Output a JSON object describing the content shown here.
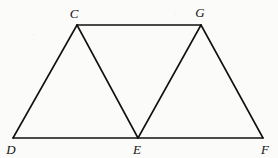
{
  "figure": {
    "background_color": "#fbfbfa",
    "stroke_color": "#111111",
    "stroke_width": 1.6,
    "width": 278,
    "height": 158,
    "points": {
      "C": {
        "label": "C",
        "x": 77,
        "y": 25
      },
      "G": {
        "label": "G",
        "x": 201,
        "y": 25
      },
      "D": {
        "label": "D",
        "x": 13,
        "y": 138
      },
      "E": {
        "label": "E",
        "x": 138,
        "y": 138
      },
      "F": {
        "label": "F",
        "x": 263,
        "y": 138
      }
    },
    "labels": [
      {
        "name": "vertex-label-C",
        "text": "C",
        "x": 74,
        "y": 13
      },
      {
        "name": "vertex-label-G",
        "text": "G",
        "x": 200,
        "y": 12
      },
      {
        "name": "vertex-label-D",
        "text": "D",
        "x": 11,
        "y": 149
      },
      {
        "name": "vertex-label-E",
        "text": "E",
        "x": 137,
        "y": 149
      },
      {
        "name": "vertex-label-F",
        "text": "F",
        "x": 265,
        "y": 149
      }
    ],
    "segments": [
      {
        "name": "segment-CG",
        "from": "C",
        "to": "G",
        "x1": 77,
        "y1": 25,
        "x2": 201,
        "y2": 25
      },
      {
        "name": "segment-DF",
        "from": "D",
        "to": "F",
        "x1": 13,
        "y1": 138,
        "x2": 263,
        "y2": 138
      },
      {
        "name": "segment-DC",
        "from": "D",
        "to": "C",
        "x1": 13,
        "y1": 138,
        "x2": 77,
        "y2": 25
      },
      {
        "name": "segment-CE",
        "from": "C",
        "to": "E",
        "x1": 77,
        "y1": 25,
        "x2": 138,
        "y2": 138
      },
      {
        "name": "segment-EG",
        "from": "E",
        "to": "G",
        "x1": 138,
        "y1": 138,
        "x2": 201,
        "y2": 25
      },
      {
        "name": "segment-GF",
        "from": "G",
        "to": "F",
        "x1": 201,
        "y1": 25,
        "x2": 263,
        "y2": 138
      }
    ]
  }
}
